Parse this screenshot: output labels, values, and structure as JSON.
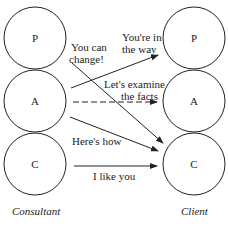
{
  "consultant": {
    "label": "Consultant",
    "states": [
      {
        "id": "P",
        "label": "P"
      },
      {
        "id": "A",
        "label": "A"
      },
      {
        "id": "C",
        "label": "C"
      }
    ]
  },
  "client": {
    "label": "Client",
    "states": [
      {
        "id": "P",
        "label": "P"
      },
      {
        "id": "A",
        "label": "A"
      },
      {
        "id": "C",
        "label": "C"
      }
    ]
  },
  "transactions": [
    {
      "from": "Consultant.A",
      "to": "Client.P",
      "label_lines": [
        "You're in",
        "the way"
      ],
      "style": "solid"
    },
    {
      "from": "Consultant.P",
      "to": "Client.C",
      "label_lines": [
        "You can",
        "change!"
      ],
      "style": "solid"
    },
    {
      "from": "Consultant.A",
      "to": "Client.A",
      "label_lines": [
        "Let's examine",
        "the facts"
      ],
      "style": "dashed"
    },
    {
      "from": "Consultant.A",
      "to": "Client.C",
      "label_lines": [
        "Here's how"
      ],
      "style": "solid"
    },
    {
      "from": "Consultant.C",
      "to": "Client.C",
      "label_lines": [
        "I like you"
      ],
      "style": "solid"
    }
  ],
  "colors": {
    "stroke": "#222222",
    "background": "#ffffff"
  }
}
